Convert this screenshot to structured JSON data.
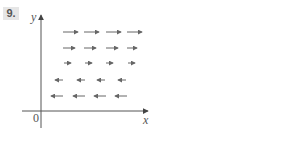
{
  "problem": {
    "number": "9."
  },
  "diagram": {
    "type": "vector-field",
    "axes": {
      "x_label": "x",
      "y_label": "y",
      "origin_label": "0"
    },
    "arrow_color": "#666666",
    "axis_color": "#555555",
    "rows": [
      {
        "direction": "right",
        "y": 32,
        "arrows": [
          [
            63,
            78
          ],
          [
            84,
            99
          ],
          [
            106,
            121
          ],
          [
            127,
            142
          ]
        ]
      },
      {
        "direction": "right",
        "y": 48,
        "arrows": [
          [
            63,
            75
          ],
          [
            84,
            96
          ],
          [
            106,
            118
          ],
          [
            127,
            137
          ]
        ]
      },
      {
        "direction": "right",
        "y": 63,
        "arrows": [
          [
            64,
            71
          ],
          [
            85,
            92
          ],
          [
            106,
            113
          ],
          [
            128,
            135
          ]
        ]
      },
      {
        "direction": "left",
        "y": 80,
        "arrows": [
          [
            55,
            63
          ],
          [
            77,
            85
          ],
          [
            97,
            105
          ],
          [
            118,
            126
          ]
        ]
      },
      {
        "direction": "left",
        "y": 96,
        "arrows": [
          [
            51,
            63
          ],
          [
            73,
            85
          ],
          [
            94,
            106
          ],
          [
            115,
            127
          ]
        ]
      }
    ]
  }
}
